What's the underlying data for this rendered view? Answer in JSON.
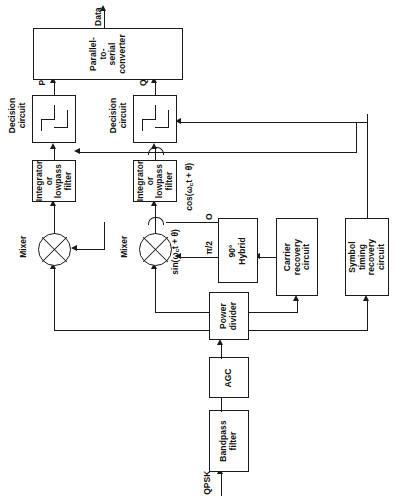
{
  "diagram": {
    "type": "block-diagram",
    "orientation": "rotated-90-ccw",
    "signal_labels": {
      "input": "QPSK",
      "output": "Data",
      "branch_p": "P",
      "branch_q": "Q",
      "hybrid_port_0": "O",
      "hybrid_port_pi2": "π/2",
      "lo_cos": "cos(ω",
      "lo_cos_sub": "c",
      "lo_cos_tail": "t + θ)",
      "lo_sin": "sin(ω",
      "lo_sin_sub": "c",
      "lo_sin_tail": "t + θ)"
    },
    "blocks": [
      {
        "id": "bandpass",
        "label": "Bandpass\nfilter"
      },
      {
        "id": "agc",
        "label": "AGC"
      },
      {
        "id": "power-divider",
        "label": "Power\ndivider"
      },
      {
        "id": "hybrid",
        "label": "90°\nHybrid"
      },
      {
        "id": "carrier-recovery",
        "label": "Carrier\nrecovery\ncircuit"
      },
      {
        "id": "symbol-timing-recovery",
        "label": "Symbol\ntiming\nrecovery\ncircuit"
      },
      {
        "id": "mixer-p",
        "label": "Mixer"
      },
      {
        "id": "mixer-q",
        "label": "Mixer"
      },
      {
        "id": "integrator-p",
        "label": "Integrator\nor\nlowpass\nfilter"
      },
      {
        "id": "integrator-q",
        "label": "Integrator\nor\nlowpass\nfilter"
      },
      {
        "id": "decision-p",
        "label": "Decision\ncircuit"
      },
      {
        "id": "decision-q",
        "label": "Decision\ncircuit"
      },
      {
        "id": "converter",
        "label": "Parallel-\nto-\nserial\nconverter"
      }
    ],
    "colors": {
      "line": "#1a1a1a",
      "background": "#ffffff",
      "text": "#111111"
    }
  }
}
